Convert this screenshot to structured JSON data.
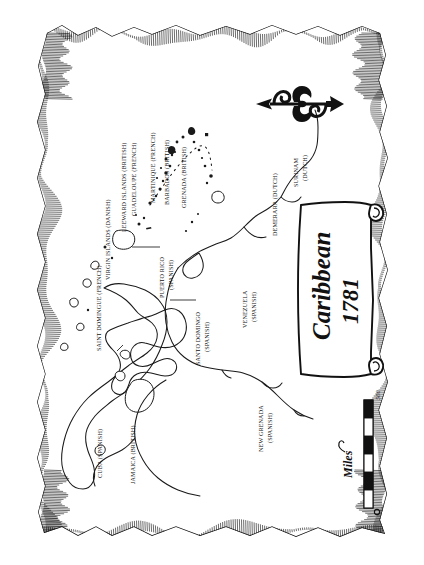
{
  "document": {
    "kind": "antique-parchment-map",
    "title_cartouche": {
      "title": "Caribbean",
      "year": "1781"
    },
    "background_color": "#ffffff",
    "ink_color": "#1a1a1a"
  },
  "compass": {
    "name": "north-arrow-fleur-de-lis",
    "points_direction": "north (toward left edge of rotated page)"
  },
  "scale_bar": {
    "label": "Miles",
    "min_value": "0",
    "max_value": "500",
    "segments": 6
  },
  "chart_data": {
    "type": "map",
    "title": "Caribbean 1781",
    "projection_note": "page rotated 90 degrees; north points to page-left",
    "scale": {
      "label": "Miles",
      "from": 0,
      "to": 500
    },
    "labels": [
      {
        "id": "saint-domingue",
        "text": "SAINT DOMINGUE (FRENCH)",
        "power": "French"
      },
      {
        "id": "virgin-islands",
        "text": "VIRGIN ISLANDS (DANISH)",
        "power": "Danish"
      },
      {
        "id": "leeward-islands",
        "text": "LEEWARD ISLANDS (BRITISH)",
        "power": "British"
      },
      {
        "id": "guadeloupe",
        "text": "GUADELOUPE (FRENCH)",
        "power": "French"
      },
      {
        "id": "martinique",
        "text": "MARTINIQUE (FRENCH)",
        "power": "French"
      },
      {
        "id": "barbados",
        "text": "BARBADOS (BRITISH)",
        "power": "British"
      },
      {
        "id": "grenada",
        "text": "GRENADA (BRITISH)",
        "power": "British"
      },
      {
        "id": "puerto-rico",
        "text": "PUERTO RICO",
        "text2": "(SPANISH)",
        "power": "Spanish"
      },
      {
        "id": "santo-domingo",
        "text": "SANTO DOMINGO",
        "text2": "(SPANISH)",
        "power": "Spanish"
      },
      {
        "id": "cuba",
        "text": "CUBA (SPANISH)",
        "power": "Spanish"
      },
      {
        "id": "jamaica",
        "text": "JAMAICA (BRITISH)",
        "power": "British"
      },
      {
        "id": "venezuela",
        "text": "VENEZUELA",
        "text2": "(SPANISH)",
        "power": "Spanish"
      },
      {
        "id": "new-grenada",
        "text": "NEW GRENADA",
        "text2": "(SPANISH)",
        "power": "Spanish"
      },
      {
        "id": "demerara",
        "text": "DEMERARA (DUTCH)",
        "power": "Dutch"
      },
      {
        "id": "surinam",
        "text": "SURINAM",
        "text2": "(DUTCH)",
        "power": "Dutch"
      }
    ]
  },
  "map_labels": {
    "saint_domingue": "SAINT DOMINGUE (FRENCH)",
    "virgin_islands": "VIRGIN ISLANDS (DANISH)",
    "leeward_islands": "LEEWARD ISLANDS (BRITISH)",
    "guadeloupe": "GUADELOUPE (FRENCH)",
    "martinique": "MARTINIQUE (FRENCH)",
    "barbados": "BARBADOS (BRITISH)",
    "grenada": "GRENADA (BRITISH)",
    "puerto_rico_l1": "PUERTO RICO",
    "puerto_rico_l2": "(SPANISH)",
    "santo_domingo_l1": "SANTO DOMINGO",
    "santo_domingo_l2": "(SPANISH)",
    "cuba": "CUBA (SPANISH)",
    "jamaica": "JAMAICA (BRITISH)",
    "venezuela_l1": "VENEZUELA",
    "venezuela_l2": "(SPANISH)",
    "new_grenada_l1": "NEW GRENADA",
    "new_grenada_l2": "(SPANISH)",
    "demerara": "DEMERARA (DUTCH)",
    "surinam_l1": "SURINAM",
    "surinam_l2": "(DUTCH)"
  }
}
